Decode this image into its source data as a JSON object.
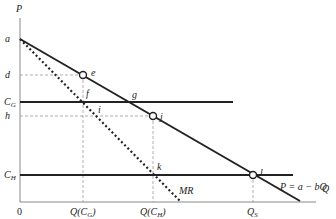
{
  "axes": {
    "y_label": "P",
    "x_label": "Q",
    "origin": "0"
  },
  "price_labels": {
    "a": "a",
    "d": "d",
    "cg": "C",
    "cg_sub": "G",
    "h": "h",
    "ch": "C",
    "ch_sub": "H"
  },
  "quantity_labels": {
    "qg": "Q(C",
    "qg_sub": "G",
    "qg_end": ")",
    "qh": "Q(C",
    "qh_sub": "H",
    "qh_end": ")",
    "qs": "Q",
    "qs_sub": "S"
  },
  "points": {
    "e": "e",
    "f": "f",
    "g": "g",
    "i": "i",
    "j": "j",
    "k": "k",
    "l": "l"
  },
  "curves": {
    "demand": "P = a − bQ",
    "mr": "MR"
  },
  "colors": {
    "line": "#222222",
    "dash": "#999999",
    "axis": "#888888"
  }
}
